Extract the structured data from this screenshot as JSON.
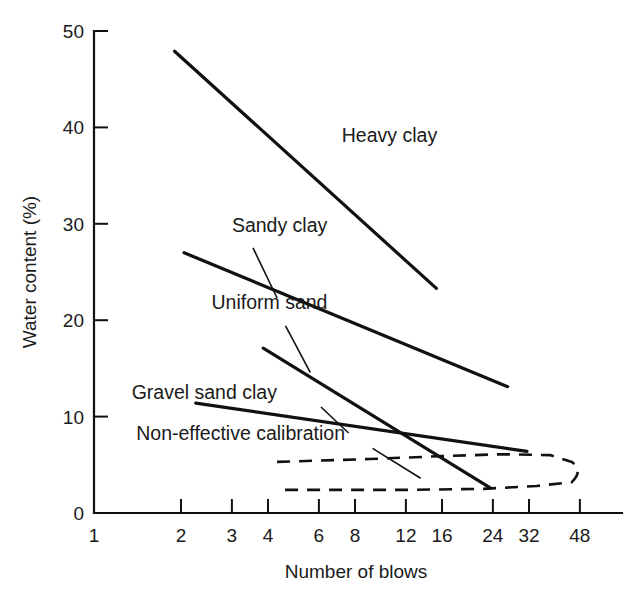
{
  "chart_data": {
    "type": "line",
    "title": "",
    "xlabel": "Number of blows",
    "ylabel": "Water content (%)",
    "xscale": "log",
    "xticks": [
      1,
      2,
      3,
      4,
      6,
      8,
      12,
      16,
      24,
      32,
      48
    ],
    "xticklabels": [
      "1",
      "2",
      "3",
      "4",
      "6",
      "8",
      "12",
      "16",
      "24",
      "32",
      "48"
    ],
    "xlim": [
      1,
      60
    ],
    "yticks": [
      0,
      10,
      20,
      30,
      40,
      50
    ],
    "yticklabels": [
      "0",
      "10",
      "20",
      "30",
      "40",
      "50"
    ],
    "ylim": [
      0,
      50
    ],
    "grid": false,
    "legend_position": "inline-annotations",
    "series": [
      {
        "name": "Heavy clay",
        "style": "solid",
        "label": "Heavy clay",
        "label_x": 7.2,
        "label_y": 38.5,
        "leader": false,
        "points": [
          [
            1.9,
            47.9
          ],
          [
            15.3,
            23.3
          ]
        ]
      },
      {
        "name": "Sandy clay",
        "style": "solid",
        "label": "Sandy clay",
        "label_x": 3.0,
        "label_y": 29.2,
        "leader": true,
        "leader_from": [
          3.55,
          27.5
        ],
        "leader_to": [
          4.3,
          22.3
        ],
        "points": [
          [
            2.05,
            27.0
          ],
          [
            27.0,
            13.1
          ]
        ]
      },
      {
        "name": "Uniform sand",
        "style": "solid",
        "label": "Uniform sand",
        "label_x": 2.55,
        "label_y": 21.2,
        "leader": true,
        "leader_from": [
          4.6,
          19.4
        ],
        "leader_to": [
          5.6,
          14.6
        ],
        "points": [
          [
            3.85,
            17.1
          ],
          [
            23.5,
            2.6
          ]
        ]
      },
      {
        "name": "Gravel sand clay",
        "style": "solid",
        "label": "Gravel sand clay",
        "label_x": 1.35,
        "label_y": 11.8,
        "leader": true,
        "leader_from": [
          6.1,
          11.0
        ],
        "leader_to": [
          7.6,
          8.3
        ],
        "points": [
          [
            2.25,
            11.4
          ],
          [
            31.5,
            6.4
          ]
        ]
      },
      {
        "name": "Non-effective calibration",
        "style": "dashed",
        "label": "Non-effective calibration",
        "label_x": 1.4,
        "label_y": 7.6,
        "leader": true,
        "leader_from": [
          9.2,
          6.7
        ],
        "leader_to": [
          13.5,
          3.6
        ],
        "loop": {
          "upper": [
            [
              4.3,
              5.3
            ],
            [
              9.0,
              5.6
            ],
            [
              16.0,
              5.9
            ],
            [
              26.0,
              6.1
            ],
            [
              38.0,
              6.0
            ],
            [
              45.0,
              5.3
            ]
          ],
          "right_cap": [
            [
              45.0,
              5.3
            ],
            [
              49.5,
              4.4
            ],
            [
              45.0,
              3.2
            ]
          ],
          "lower": [
            [
              45.0,
              3.2
            ],
            [
              34.0,
              2.8
            ],
            [
              22.0,
              2.5
            ],
            [
              12.0,
              2.4
            ],
            [
              4.3,
              2.4
            ]
          ]
        }
      }
    ]
  },
  "axes": {
    "y_axis_title": "Water content (%)",
    "x_axis_title": "Number of blows"
  }
}
